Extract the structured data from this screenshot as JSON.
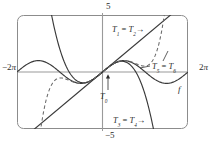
{
  "figure": {
    "frame": {
      "x": 17,
      "y": 15,
      "width": 171,
      "height": 114,
      "corner_radius": 6,
      "stroke": "#8c8c8c",
      "stroke_width": 1
    },
    "axis_color": "#9a9a9a",
    "curve_color": "#3a3a3a",
    "label_color": "#2b2b2b",
    "background": "#ffffff"
  },
  "axis_labels": {
    "top": "5",
    "bottom": "−5",
    "left_num": "−2",
    "left_pi": "π",
    "right_num": "2",
    "right_pi": "π"
  },
  "curve_labels": [
    {
      "id": "t12",
      "base": "T",
      "sub1": "1",
      "sub2": "2",
      "eq": "=",
      "arrow": "→",
      "dashed": false
    },
    {
      "id": "t56",
      "base": "T",
      "sub1": "5",
      "sub2": "6",
      "eq": "=",
      "arrow": "",
      "dashed": true
    },
    {
      "id": "t34",
      "base": "T",
      "sub1": "3",
      "sub2": "4",
      "eq": "=",
      "arrow": "→",
      "dashed": false
    },
    {
      "id": "t0",
      "base": "T",
      "sub1": "0",
      "sub2": "",
      "eq": "",
      "arrow": "",
      "dashed": false
    }
  ],
  "function_label": "f",
  "chart_data": {
    "type": "line",
    "title": "",
    "xlabel": "",
    "ylabel": "",
    "xlim": [
      -6.283185307,
      6.283185307
    ],
    "ylim": [
      -5,
      5
    ],
    "grid": false,
    "legend": "inline-annotations",
    "xtick_labels": [
      "−2π",
      "2π"
    ],
    "ytick_labels": [
      "5",
      "−5"
    ],
    "series": [
      {
        "name": "f",
        "expression": "sin(x)",
        "style": "solid",
        "label": "f",
        "samples": 240
      },
      {
        "name": "T1 = T2",
        "expression": "x",
        "style": "solid",
        "label": "T1 = T2",
        "samples": 2
      },
      {
        "name": "T3 = T4",
        "expression": "x - x^3/6",
        "style": "solid",
        "label": "T3 = T4",
        "samples": 240
      },
      {
        "name": "T5 = T6",
        "expression": "x - x^3/6 + x^5/120",
        "style": "dashed",
        "label": "T5 = T6",
        "samples": 240
      },
      {
        "name": "T0",
        "expression": "0",
        "style": "solid",
        "label": "T0",
        "samples": 2
      }
    ]
  }
}
